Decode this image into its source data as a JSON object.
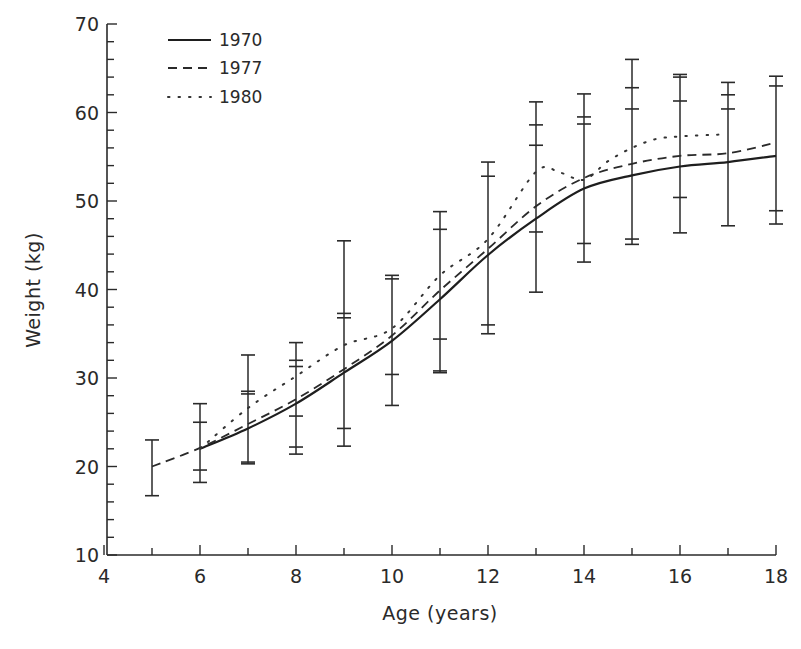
{
  "chart_data": {
    "type": "line",
    "title": "",
    "xlabel": "Age (years)",
    "ylabel": "Weight (kg)",
    "xlim": [
      4,
      18
    ],
    "ylim": [
      10,
      70
    ],
    "x_ticks_major": [
      4,
      6,
      8,
      10,
      12,
      14,
      16,
      18
    ],
    "x_ticks_minor": [
      5,
      7,
      9,
      11,
      13,
      15,
      17
    ],
    "y_ticks_major": [
      10,
      20,
      30,
      40,
      50,
      60,
      70
    ],
    "y_minor_step": 2,
    "grid": false,
    "legend_position": "upper-left",
    "series": [
      {
        "name": "1970",
        "style": "solid",
        "x": [
          6,
          7,
          8,
          9,
          10,
          11,
          12,
          13,
          14,
          15,
          16,
          17,
          18
        ],
        "values": [
          22.0,
          24.3,
          27.1,
          30.6,
          34.2,
          38.9,
          43.9,
          48.0,
          51.4,
          52.9,
          53.9,
          54.4,
          55.1
        ]
      },
      {
        "name": "1977",
        "style": "dashed",
        "x": [
          5,
          6,
          7,
          8,
          9,
          10,
          11,
          12,
          13,
          14,
          15,
          16,
          17,
          18
        ],
        "values": [
          20.0,
          22.1,
          24.8,
          27.6,
          31.0,
          34.8,
          39.9,
          44.6,
          49.4,
          52.6,
          54.2,
          55.1,
          55.4,
          56.6
        ]
      },
      {
        "name": "1980",
        "style": "dotted",
        "x": [
          6,
          7,
          8,
          9,
          10,
          11,
          12,
          13,
          13.5,
          14,
          14.5,
          15,
          15.5,
          16,
          16.8
        ],
        "values": [
          22.0,
          26.6,
          30.2,
          33.7,
          35.6,
          41.6,
          45.7,
          53.3,
          53.2,
          52.4,
          54.5,
          56.0,
          57.0,
          57.3,
          57.5
        ]
      }
    ],
    "error_bars": [
      {
        "age": 5,
        "caps": [
          23.0,
          16.7
        ]
      },
      {
        "age": 6,
        "caps": [
          27.1,
          25.0,
          19.6,
          18.2
        ]
      },
      {
        "age": 7,
        "caps": [
          32.6,
          28.5,
          28.2,
          20.5,
          20.3
        ]
      },
      {
        "age": 8,
        "caps": [
          34.0,
          32.0,
          31.3,
          25.7,
          22.2,
          21.4
        ]
      },
      {
        "age": 9,
        "caps": [
          45.5,
          37.3,
          36.8,
          24.3,
          22.3
        ]
      },
      {
        "age": 10,
        "caps": [
          41.6,
          41.2,
          30.4,
          26.9
        ]
      },
      {
        "age": 11,
        "caps": [
          48.8,
          46.8,
          34.4,
          30.8,
          30.6
        ]
      },
      {
        "age": 12,
        "caps": [
          54.4,
          52.8,
          36.0,
          35.0
        ]
      },
      {
        "age": 13,
        "caps": [
          61.2,
          58.6,
          56.3,
          46.5,
          39.7
        ]
      },
      {
        "age": 14,
        "caps": [
          62.1,
          59.5,
          58.7,
          45.2,
          43.1
        ]
      },
      {
        "age": 15,
        "caps": [
          66.0,
          62.8,
          60.4,
          45.7,
          45.1
        ]
      },
      {
        "age": 16,
        "caps": [
          64.3,
          64.0,
          61.3,
          50.4,
          46.4
        ]
      },
      {
        "age": 17,
        "caps": [
          63.4,
          62.0,
          60.4,
          47.2
        ]
      },
      {
        "age": 18,
        "caps": [
          64.1,
          63.0,
          48.9,
          47.4
        ]
      }
    ]
  },
  "legend": {
    "items": [
      {
        "label": "1970",
        "style": "solid"
      },
      {
        "label": "1977",
        "style": "dashed"
      },
      {
        "label": "1980",
        "style": "dotted"
      }
    ]
  },
  "axes": {
    "x_label": "Age (years)",
    "y_label": "Weight (kg)"
  }
}
